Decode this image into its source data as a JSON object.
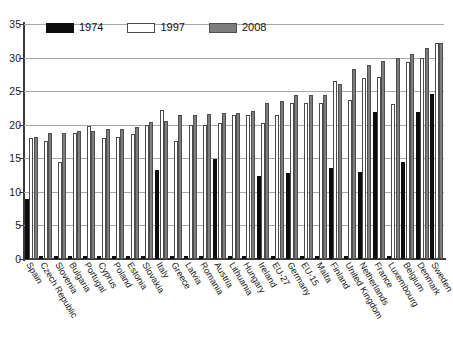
{
  "chart_data": {
    "type": "bar",
    "title": "",
    "subtitle": "",
    "xlabel": "",
    "ylabel": "",
    "ylim": [
      0,
      35
    ],
    "yticks": [
      0,
      5,
      10,
      15,
      20,
      25,
      30,
      35
    ],
    "grid": true,
    "legend_position": "top-left",
    "categories": [
      "Spain",
      "Czech Republic",
      "Slovenia",
      "Bulgaria",
      "Portugal",
      "Cyprus",
      "Poland",
      "Estonia",
      "Slovakia",
      "Italy",
      "Greece",
      "Latvia",
      "Romania",
      "Austria",
      "Lithuania",
      "Hungary",
      "Ireland",
      "EU-27",
      "Germany",
      "EU-15",
      "Malta",
      "Finland",
      "United Kingdom",
      "Netherlands",
      "France",
      "Luxembourg",
      "Belgium",
      "Denmark",
      "Sweden"
    ],
    "series": [
      {
        "name": "1974",
        "color": "#0d0d0d",
        "values": [
          9.0,
          null,
          null,
          null,
          null,
          null,
          null,
          null,
          null,
          13.3,
          null,
          null,
          null,
          14.9,
          null,
          null,
          12.4,
          null,
          12.8,
          null,
          null,
          13.5,
          null,
          13.0,
          21.9,
          null,
          14.5,
          21.9,
          24.6
        ]
      },
      {
        "name": "1997",
        "color": "#ffffff",
        "values": [
          18.0,
          17.6,
          14.5,
          18.8,
          19.8,
          18.0,
          18.2,
          18.6,
          20.0,
          22.2,
          17.6,
          20.0,
          20.0,
          20.3,
          21.5,
          21.5,
          20.3,
          21.5,
          23.3,
          23.3,
          23.3,
          26.5,
          23.7,
          27.0,
          27.1,
          23.1,
          29.4,
          30.0,
          32.2
        ]
      },
      {
        "name": "2008",
        "color": "#7d7d7d",
        "values": [
          18.1,
          18.7,
          18.8,
          19.0,
          19.1,
          19.3,
          19.4,
          19.6,
          20.4,
          20.5,
          21.4,
          21.5,
          21.6,
          21.7,
          21.8,
          22.1,
          23.3,
          23.5,
          24.5,
          24.5,
          24.5,
          26.0,
          28.3,
          28.9,
          29.5,
          29.9,
          30.6,
          31.5,
          32.2
        ]
      }
    ]
  },
  "axis": {
    "ytick_labels": [
      "0",
      "5",
      "10",
      "15",
      "20",
      "25",
      "30",
      "35"
    ]
  },
  "legend": {
    "items": [
      {
        "label": "1974"
      },
      {
        "label": "1997"
      },
      {
        "label": "2008"
      }
    ]
  }
}
